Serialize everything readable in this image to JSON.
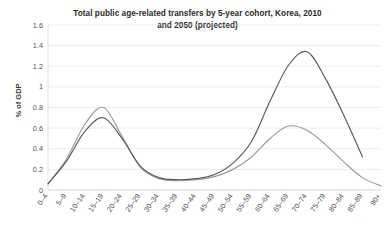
{
  "chart_data": {
    "type": "line",
    "title": "Total public age-related transfers by 5-year cohort, Korea, 2010 and 2050 (projected)",
    "title_line1": "Total public age-related transfers by 5-year cohort, Korea, 2010",
    "title_line2": "and 2050 (projected)",
    "xlabel": "",
    "ylabel": "% of GDP",
    "ylim": [
      0,
      1.6
    ],
    "yticks": [
      0,
      0.2,
      0.4,
      0.6,
      0.8,
      1,
      1.2,
      1.4,
      1.6
    ],
    "ytick_labels": [
      "0",
      "0.2",
      "0.4",
      "0.6",
      "0.8",
      "1",
      "1.2",
      "1.4",
      "1.6"
    ],
    "grid": true,
    "legend": "none",
    "categories": [
      "0–4",
      "5–9",
      "10–14",
      "15–19",
      "20–24",
      "25–29",
      "30–34",
      "35–39",
      "40–44",
      "45–49",
      "50–54",
      "55–59",
      "60–64",
      "65–69",
      "70–74",
      "75–79",
      "80–84",
      "85–89",
      "90+"
    ],
    "series": [
      {
        "name": "2010",
        "color": "#9a9a9a",
        "values": [
          0.06,
          0.3,
          0.64,
          0.8,
          0.52,
          0.22,
          0.11,
          0.09,
          0.1,
          0.13,
          0.2,
          0.32,
          0.5,
          0.62,
          0.58,
          0.44,
          0.27,
          0.12,
          0.04
        ]
      },
      {
        "name": "2050 (projected)",
        "color": "#595959",
        "values": [
          0.06,
          0.28,
          0.57,
          0.7,
          0.5,
          0.23,
          0.12,
          0.1,
          0.11,
          0.15,
          0.26,
          0.47,
          0.86,
          1.21,
          1.34,
          1.08,
          0.72,
          0.32,
          null
        ]
      }
    ]
  },
  "axes": {
    "ytick_0": "0",
    "ytick_1": "0.2",
    "ytick_2": "0.4",
    "ytick_3": "0.6",
    "ytick_4": "0.8",
    "ytick_5": "1",
    "ytick_6": "1.2",
    "ytick_7": "1.4",
    "ytick_8": "1.6",
    "y_axis_title": "% of GDP"
  }
}
